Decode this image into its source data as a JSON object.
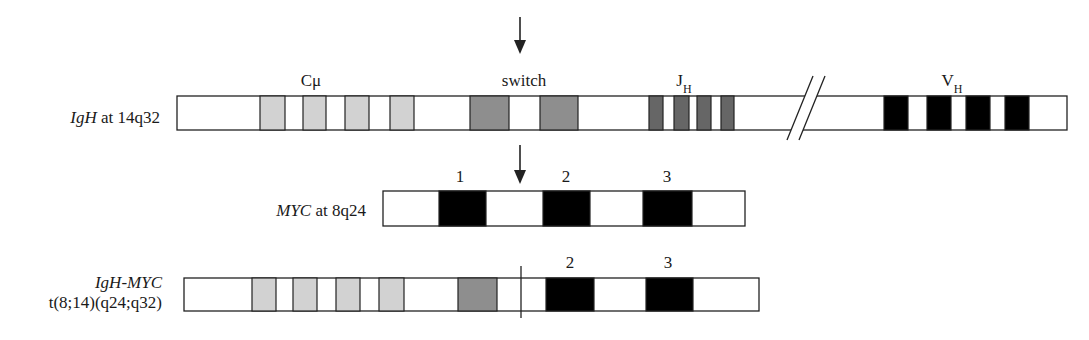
{
  "colors": {
    "outline": "#222222",
    "constant": "#d2d2d2",
    "switch": "#8e8e8e",
    "joining": "#666666",
    "variable": "#000000",
    "exon": "#000000",
    "blank": "#ffffff"
  },
  "arrows": [
    {
      "name": "igh-switch-breakpoint-arrow",
      "x": 520,
      "y1": 17,
      "y2": 54
    },
    {
      "name": "myc-intron-breakpoint-arrow",
      "x": 520,
      "y1": 145,
      "y2": 184
    }
  ],
  "rows": [
    {
      "id": "igh",
      "label": [
        {
          "text": "IgH",
          "italic": true
        },
        {
          "text": " at 14q32",
          "italic": false
        }
      ],
      "label_x": 160,
      "label_y": 123,
      "bar": {
        "x1": 177,
        "x2": 1067,
        "y": 96,
        "h": 34
      },
      "break": {
        "x_bottom_1": 787,
        "x_top_1": 813,
        "x_bottom_2": 799,
        "x_top_2": 825,
        "y_top": 76,
        "y_bottom": 140
      },
      "blocks": [
        {
          "x1": 260,
          "x2": 285,
          "fill": "constant"
        },
        {
          "x1": 303,
          "x2": 326,
          "fill": "constant"
        },
        {
          "x1": 345,
          "x2": 369,
          "fill": "constant"
        },
        {
          "x1": 390,
          "x2": 414,
          "fill": "constant"
        },
        {
          "x1": 470,
          "x2": 509,
          "fill": "switch"
        },
        {
          "x1": 540,
          "x2": 578,
          "fill": "switch"
        },
        {
          "x1": 649,
          "x2": 663,
          "fill": "joining"
        },
        {
          "x1": 674,
          "x2": 689,
          "fill": "joining"
        },
        {
          "x1": 697,
          "x2": 711,
          "fill": "joining"
        },
        {
          "x1": 721,
          "x2": 734,
          "fill": "joining"
        },
        {
          "x1": 884,
          "x2": 908,
          "fill": "variable"
        },
        {
          "x1": 927,
          "x2": 951,
          "fill": "variable"
        },
        {
          "x1": 966,
          "x2": 990,
          "fill": "variable"
        },
        {
          "x1": 1005,
          "x2": 1029,
          "fill": "variable"
        }
      ],
      "region_labels": [
        {
          "name": "c-mu-label",
          "text": "Cμ",
          "sub": "",
          "x": 311,
          "y": 86
        },
        {
          "name": "switch-label",
          "text": "switch",
          "sub": "",
          "x": 524,
          "y": 86
        },
        {
          "name": "jh-label",
          "text": "J",
          "sub": "H",
          "x": 684,
          "y": 86
        },
        {
          "name": "vh-label",
          "text": "V",
          "sub": "H",
          "x": 952,
          "y": 86
        }
      ]
    },
    {
      "id": "myc",
      "label": [
        {
          "text": "MYC",
          "italic": true
        },
        {
          "text": " at 8q24",
          "italic": false
        }
      ],
      "label_x": 366,
      "label_y": 216,
      "bar": {
        "x1": 383,
        "x2": 745,
        "y": 191,
        "h": 35
      },
      "blocks": [
        {
          "x1": 439,
          "x2": 486,
          "fill": "exon"
        },
        {
          "x1": 543,
          "x2": 590,
          "fill": "exon"
        },
        {
          "x1": 643,
          "x2": 692,
          "fill": "exon"
        }
      ],
      "region_labels": [
        {
          "name": "exon-1-label",
          "text": "1",
          "sub": "",
          "x": 460,
          "y": 182
        },
        {
          "name": "exon-2-label",
          "text": "2",
          "sub": "",
          "x": 566,
          "y": 182
        },
        {
          "name": "exon-3-label",
          "text": "3",
          "sub": "",
          "x": 667,
          "y": 182
        }
      ]
    },
    {
      "id": "fusion",
      "label": [
        {
          "text": "IgH-MYC",
          "italic": true
        }
      ],
      "label2": "t(8;14)(q24;q32)",
      "label_x": 162,
      "label_y": 288,
      "label2_y": 308,
      "bar": {
        "x1": 184,
        "x2": 759,
        "y": 278,
        "h": 33
      },
      "breakpoint": {
        "x": 521,
        "y1": 266,
        "y2": 318
      },
      "blocks": [
        {
          "x1": 252,
          "x2": 276,
          "fill": "constant"
        },
        {
          "x1": 293,
          "x2": 317,
          "fill": "constant"
        },
        {
          "x1": 336,
          "x2": 360,
          "fill": "constant"
        },
        {
          "x1": 379,
          "x2": 404,
          "fill": "constant"
        },
        {
          "x1": 458,
          "x2": 497,
          "fill": "switch"
        },
        {
          "x1": 546,
          "x2": 594,
          "fill": "exon"
        },
        {
          "x1": 646,
          "x2": 693,
          "fill": "exon"
        }
      ],
      "region_labels": [
        {
          "name": "fusion-exon-2-label",
          "text": "2",
          "sub": "",
          "x": 570,
          "y": 268
        },
        {
          "name": "fusion-exon-3-label",
          "text": "3",
          "sub": "",
          "x": 668,
          "y": 268
        }
      ]
    }
  ]
}
